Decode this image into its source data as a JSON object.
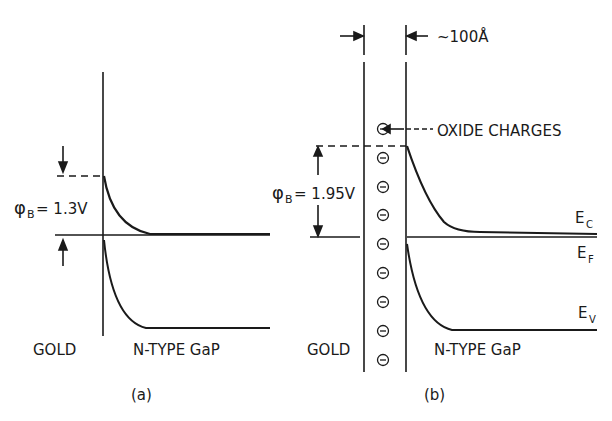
{
  "panel_a": {
    "caption": "(a)",
    "barrier_label": "φ",
    "barrier_sub": "B",
    "barrier_value": "= 1.3V",
    "metal_label": "GOLD",
    "semiconductor_label": "N-TYPE GaP"
  },
  "panel_b": {
    "caption": "(b)",
    "oxide_thickness": "~100Å",
    "oxide_charges_label": "OXIDE CHARGES",
    "barrier_label": "φ",
    "barrier_sub": "B",
    "barrier_value": "= 1.95V",
    "metal_label": "GOLD",
    "semiconductor_label": "N-TYPE GaP",
    "ec_label": "E",
    "ec_sub": "C",
    "ef_label": "E",
    "ef_sub": "F",
    "ev_label": "E",
    "ev_sub": "V",
    "charge_symbol": "−"
  },
  "colors": {
    "ink": "#1a1a1a",
    "background": "#ffffff"
  }
}
